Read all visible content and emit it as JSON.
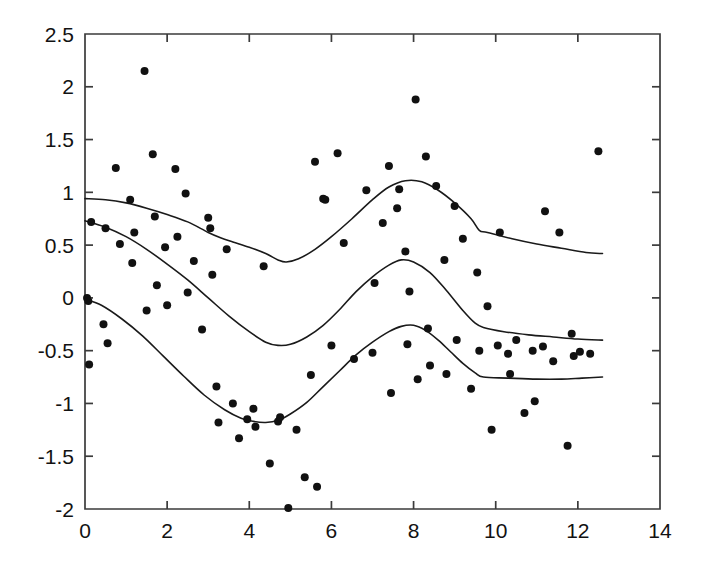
{
  "chart_data": {
    "type": "scatter",
    "title": "",
    "subtitle": "",
    "xlabel": "",
    "ylabel": "",
    "xlim": [
      0,
      14
    ],
    "ylim": [
      -2,
      2.5
    ],
    "grid": false,
    "legend": null,
    "x_ticks": [
      0,
      2,
      4,
      6,
      8,
      10,
      12,
      14
    ],
    "x_tick_labels": [
      "0",
      "2",
      "4",
      "6",
      "8",
      "10",
      "12",
      "14"
    ],
    "y_ticks": [
      -2,
      -1.5,
      -1,
      -0.5,
      0,
      0.5,
      1,
      1.5,
      2,
      2.5
    ],
    "y_tick_labels": [
      "-2",
      "-1.5",
      "-1",
      "-0.5",
      "0",
      "0.5",
      "1",
      "1.5",
      "2",
      "2.5"
    ],
    "marker": "filled-circle",
    "marker_size": 4,
    "point_color": "#111111",
    "curve_color": "#1a1a1a",
    "axis_color": "#3b3b3b",
    "background_color": "#ffffff",
    "scatter_points": [
      [
        0.05,
        0.0
      ],
      [
        0.08,
        -0.03
      ],
      [
        0.1,
        -0.63
      ],
      [
        0.15,
        0.72
      ],
      [
        0.45,
        -0.25
      ],
      [
        0.5,
        0.66
      ],
      [
        0.55,
        -0.43
      ],
      [
        0.75,
        1.23
      ],
      [
        0.85,
        0.51
      ],
      [
        1.1,
        0.93
      ],
      [
        1.15,
        0.33
      ],
      [
        1.2,
        0.62
      ],
      [
        1.45,
        2.15
      ],
      [
        1.5,
        -0.12
      ],
      [
        1.65,
        1.36
      ],
      [
        1.7,
        0.77
      ],
      [
        1.75,
        0.12
      ],
      [
        1.95,
        0.48
      ],
      [
        2.0,
        -0.07
      ],
      [
        2.2,
        1.22
      ],
      [
        2.25,
        0.58
      ],
      [
        2.45,
        0.99
      ],
      [
        2.5,
        0.05
      ],
      [
        2.65,
        0.35
      ],
      [
        2.85,
        -0.3
      ],
      [
        3.0,
        0.76
      ],
      [
        3.05,
        0.66
      ],
      [
        3.1,
        0.22
      ],
      [
        3.2,
        -0.84
      ],
      [
        3.25,
        -1.18
      ],
      [
        3.45,
        0.46
      ],
      [
        3.6,
        -1.0
      ],
      [
        3.75,
        -1.33
      ],
      [
        3.95,
        -1.15
      ],
      [
        4.1,
        -1.05
      ],
      [
        4.15,
        -1.22
      ],
      [
        4.35,
        0.3
      ],
      [
        4.5,
        -1.57
      ],
      [
        4.7,
        -1.17
      ],
      [
        4.75,
        -1.13
      ],
      [
        4.95,
        -1.99
      ],
      [
        5.15,
        -1.25
      ],
      [
        5.35,
        -1.7
      ],
      [
        5.5,
        -0.73
      ],
      [
        5.6,
        1.29
      ],
      [
        5.65,
        -1.79
      ],
      [
        5.8,
        0.94
      ],
      [
        5.85,
        0.93
      ],
      [
        6.0,
        -0.45
      ],
      [
        6.15,
        1.37
      ],
      [
        6.3,
        0.52
      ],
      [
        6.55,
        -0.58
      ],
      [
        6.85,
        1.02
      ],
      [
        7.0,
        -0.52
      ],
      [
        7.05,
        0.14
      ],
      [
        7.25,
        0.71
      ],
      [
        7.4,
        1.25
      ],
      [
        7.45,
        -0.9
      ],
      [
        7.6,
        0.85
      ],
      [
        7.65,
        1.03
      ],
      [
        7.8,
        0.44
      ],
      [
        7.85,
        -0.44
      ],
      [
        7.9,
        0.06
      ],
      [
        8.05,
        1.88
      ],
      [
        8.1,
        -0.77
      ],
      [
        8.3,
        1.34
      ],
      [
        8.35,
        -0.29
      ],
      [
        8.4,
        -0.64
      ],
      [
        8.55,
        1.06
      ],
      [
        8.75,
        0.36
      ],
      [
        8.8,
        -0.72
      ],
      [
        9.0,
        0.87
      ],
      [
        9.05,
        -0.4
      ],
      [
        9.2,
        0.56
      ],
      [
        9.4,
        -0.86
      ],
      [
        9.55,
        0.24
      ],
      [
        9.6,
        -0.5
      ],
      [
        9.8,
        -0.08
      ],
      [
        9.9,
        -1.25
      ],
      [
        10.05,
        -0.45
      ],
      [
        10.1,
        0.62
      ],
      [
        10.3,
        -0.53
      ],
      [
        10.35,
        -0.72
      ],
      [
        10.5,
        -0.4
      ],
      [
        10.7,
        -1.09
      ],
      [
        10.9,
        -0.5
      ],
      [
        10.95,
        -0.98
      ],
      [
        11.15,
        -0.46
      ],
      [
        11.2,
        0.82
      ],
      [
        11.4,
        -0.6
      ],
      [
        11.55,
        0.62
      ],
      [
        11.75,
        -1.4
      ],
      [
        11.85,
        -0.34
      ],
      [
        11.9,
        -0.55
      ],
      [
        12.05,
        -0.51
      ],
      [
        12.3,
        -0.53
      ],
      [
        12.5,
        1.39
      ]
    ],
    "series": [
      {
        "name": "upper-band",
        "style": "line",
        "points": [
          [
            0.0,
            0.94
          ],
          [
            0.5,
            0.93
          ],
          [
            1.0,
            0.9
          ],
          [
            1.5,
            0.85
          ],
          [
            2.0,
            0.79
          ],
          [
            2.5,
            0.72
          ],
          [
            3.0,
            0.62
          ],
          [
            3.3,
            0.57
          ],
          [
            3.6,
            0.53
          ],
          [
            4.0,
            0.48
          ],
          [
            4.4,
            0.42
          ],
          [
            4.7,
            0.36
          ],
          [
            4.9,
            0.34
          ],
          [
            5.2,
            0.37
          ],
          [
            5.6,
            0.46
          ],
          [
            6.0,
            0.58
          ],
          [
            6.5,
            0.75
          ],
          [
            7.0,
            0.93
          ],
          [
            7.4,
            1.05
          ],
          [
            7.8,
            1.11
          ],
          [
            8.2,
            1.1
          ],
          [
            8.6,
            1.02
          ],
          [
            9.0,
            0.9
          ],
          [
            9.4,
            0.75
          ],
          [
            9.6,
            0.64
          ],
          [
            9.8,
            0.62
          ],
          [
            10.4,
            0.56
          ],
          [
            11.0,
            0.51
          ],
          [
            11.6,
            0.47
          ],
          [
            12.2,
            0.43
          ],
          [
            12.6,
            0.42
          ]
        ]
      },
      {
        "name": "middle-band",
        "style": "line",
        "points": [
          [
            0.0,
            0.73
          ],
          [
            0.5,
            0.67
          ],
          [
            1.0,
            0.58
          ],
          [
            1.5,
            0.46
          ],
          [
            2.0,
            0.32
          ],
          [
            2.5,
            0.17
          ],
          [
            3.0,
            0.0
          ],
          [
            3.5,
            -0.17
          ],
          [
            4.0,
            -0.32
          ],
          [
            4.4,
            -0.42
          ],
          [
            4.7,
            -0.45
          ],
          [
            5.0,
            -0.44
          ],
          [
            5.4,
            -0.37
          ],
          [
            5.8,
            -0.26
          ],
          [
            6.2,
            -0.11
          ],
          [
            6.6,
            0.06
          ],
          [
            7.0,
            0.2
          ],
          [
            7.4,
            0.31
          ],
          [
            7.7,
            0.36
          ],
          [
            8.0,
            0.34
          ],
          [
            8.4,
            0.24
          ],
          [
            8.8,
            0.07
          ],
          [
            9.2,
            -0.12
          ],
          [
            9.5,
            -0.24
          ],
          [
            9.7,
            -0.28
          ],
          [
            10.2,
            -0.32
          ],
          [
            10.8,
            -0.35
          ],
          [
            11.4,
            -0.37
          ],
          [
            12.0,
            -0.39
          ],
          [
            12.6,
            -0.4
          ]
        ]
      },
      {
        "name": "lower-band",
        "style": "line",
        "points": [
          [
            0.0,
            -0.01
          ],
          [
            0.4,
            -0.07
          ],
          [
            0.9,
            -0.2
          ],
          [
            1.4,
            -0.36
          ],
          [
            1.9,
            -0.55
          ],
          [
            2.4,
            -0.74
          ],
          [
            2.9,
            -0.92
          ],
          [
            3.4,
            -1.06
          ],
          [
            3.8,
            -1.14
          ],
          [
            4.1,
            -1.17
          ],
          [
            4.4,
            -1.18
          ],
          [
            4.7,
            -1.16
          ],
          [
            5.0,
            -1.1
          ],
          [
            5.4,
            -0.99
          ],
          [
            5.8,
            -0.84
          ],
          [
            6.2,
            -0.69
          ],
          [
            6.6,
            -0.54
          ],
          [
            7.0,
            -0.42
          ],
          [
            7.4,
            -0.32
          ],
          [
            7.7,
            -0.27
          ],
          [
            8.0,
            -0.26
          ],
          [
            8.3,
            -0.31
          ],
          [
            8.6,
            -0.4
          ],
          [
            8.9,
            -0.51
          ],
          [
            9.2,
            -0.62
          ],
          [
            9.5,
            -0.71
          ],
          [
            9.7,
            -0.75
          ],
          [
            10.3,
            -0.76
          ],
          [
            11.0,
            -0.77
          ],
          [
            11.6,
            -0.77
          ],
          [
            12.1,
            -0.76
          ],
          [
            12.6,
            -0.75
          ]
        ]
      }
    ]
  },
  "axes": {
    "frame_name": "plot-frame",
    "x_axis_name": "x-axis",
    "y_axis_name": "y-axis"
  }
}
